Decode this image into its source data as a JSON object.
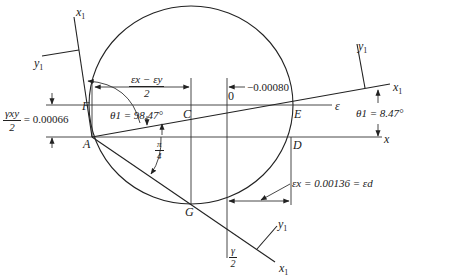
{
  "diagram": {
    "type": "Mohr's circle for strain",
    "points": {
      "A": "A",
      "C": "C",
      "O": "0",
      "E": "E",
      "D": "D",
      "F": "F",
      "G": "G"
    },
    "axes": {
      "x": "x",
      "epsilon": "ε",
      "x1": "x",
      "x1_sub": "1",
      "y1": "y",
      "y1_sub": "1",
      "gamma_half_num": "γ",
      "gamma_half_den": "2"
    },
    "annotations": {
      "half_diff_num": "εx − εy",
      "half_diff_den": "2",
      "offset_value": "−0.00080",
      "gamma_xy_num": "γxy",
      "gamma_xy_den": "2",
      "gamma_xy_value": "= 0.00066",
      "theta1_large": "θ1 = 98.47°",
      "theta1_small": "θ1 = 8.47°",
      "pi_num": "π",
      "pi_den": "4",
      "eps_x_value": "εx = 0.00136 = εd"
    },
    "colors": {
      "ink": "#222222",
      "background": "#ffffff"
    }
  }
}
